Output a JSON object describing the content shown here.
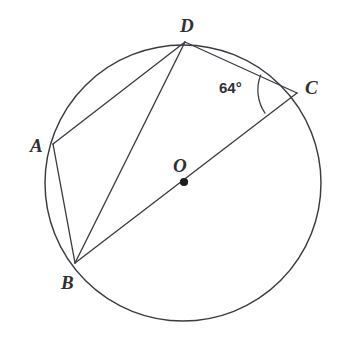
{
  "figure": {
    "background_color": "#ffffff",
    "stroke_color": "#3b3b42",
    "label_color": "#2f2f34"
  },
  "circle": {
    "center_label": "O",
    "center_x": 183,
    "center_y": 183,
    "radius": 138
  },
  "points": {
    "A": {
      "label": "A",
      "x": 53,
      "y": 144
    },
    "B": {
      "label": "B",
      "x": 75,
      "y": 263
    },
    "C": {
      "label": "C",
      "x": 297,
      "y": 93
    },
    "D": {
      "label": "D",
      "x": 185,
      "y": 42
    },
    "O": {
      "label": "O",
      "x": 184,
      "y": 182
    }
  },
  "chords": [
    {
      "name": "chord-AD",
      "from": "A",
      "to": "D"
    },
    {
      "name": "chord-AB",
      "from": "A",
      "to": "B"
    },
    {
      "name": "chord-BD",
      "from": "B",
      "to": "D"
    },
    {
      "name": "chord-DC",
      "from": "D",
      "to": "C"
    },
    {
      "name": "diameter-BC",
      "from": "B",
      "to": "C"
    }
  ],
  "angles": [
    {
      "name": "angle-DCB",
      "vertex": "C",
      "rays": [
        "D",
        "B"
      ],
      "value": "64°",
      "measure_degrees": 64
    }
  ]
}
